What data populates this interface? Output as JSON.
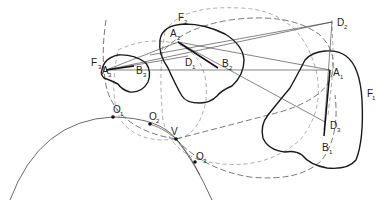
{
  "diagram": {
    "figures": [
      {
        "id": "F1",
        "label": "F",
        "sub": "1"
      },
      {
        "id": "F2",
        "label": "F",
        "sub": "2"
      },
      {
        "id": "F3",
        "label": "F",
        "sub": "3"
      }
    ],
    "points": [
      {
        "id": "A1",
        "label": "A",
        "sub": "1"
      },
      {
        "id": "B1",
        "label": "B",
        "sub": "1"
      },
      {
        "id": "A2",
        "label": "A",
        "sub": "2"
      },
      {
        "id": "B2",
        "label": "B",
        "sub": "2"
      },
      {
        "id": "A3",
        "label": "A",
        "sub": "3"
      },
      {
        "id": "B3",
        "label": "B",
        "sub": "3"
      },
      {
        "id": "D1",
        "label": "D",
        "sub": "1"
      },
      {
        "id": "D2",
        "label": "D",
        "sub": "2"
      },
      {
        "id": "D3",
        "label": "D",
        "sub": "3"
      },
      {
        "id": "O1",
        "label": "O",
        "sub": "1"
      },
      {
        "id": "O2",
        "label": "O",
        "sub": "2"
      },
      {
        "id": "O3",
        "label": "O",
        "sub": "3"
      },
      {
        "id": "V",
        "label": "V",
        "sub": ""
      }
    ]
  }
}
